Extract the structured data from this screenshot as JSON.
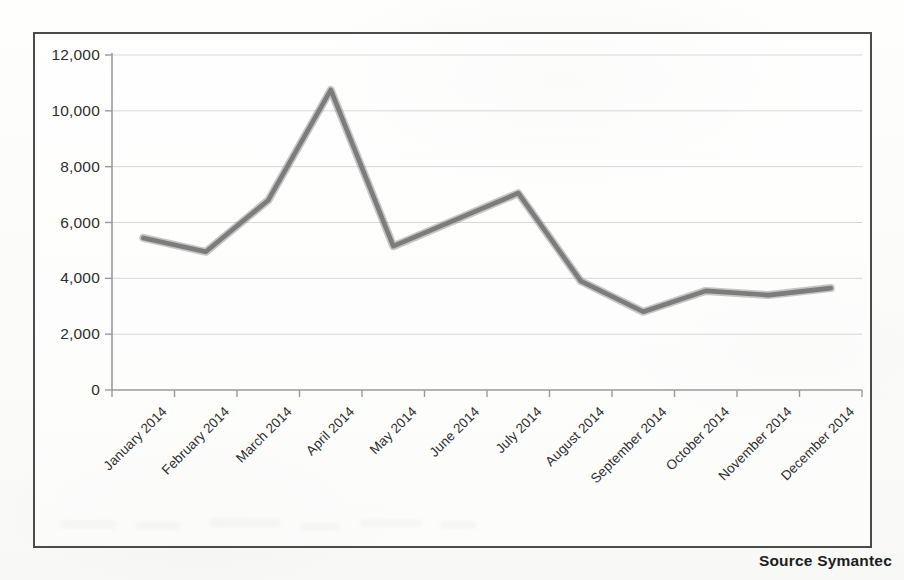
{
  "figure": {
    "source_note": "Source Symantec",
    "frame_color": "#4b4b4b",
    "line_color": "#7c7c7c",
    "gridline_color": "#d7d7d7",
    "axis_color": "#9a9a9a"
  },
  "chart_data": {
    "type": "line",
    "title": "",
    "subtitle": "",
    "xlabel": "",
    "ylabel": "",
    "categories": [
      "January 2014",
      "February 2014",
      "March 2014",
      "April 2014",
      "May 2014",
      "June 2014",
      "July 2014",
      "August 2014",
      "September 2014",
      "October 2014",
      "November 2014",
      "December 2014"
    ],
    "values": [
      5450,
      4950,
      6800,
      10750,
      5150,
      6100,
      7050,
      3900,
      2800,
      3550,
      3400,
      3650
    ],
    "series": [
      {
        "name": "",
        "values": [
          5450,
          4950,
          6800,
          10750,
          5150,
          6100,
          7050,
          3900,
          2800,
          3550,
          3400,
          3650
        ]
      }
    ],
    "ylim": [
      0,
      12000
    ],
    "ytick_values": [
      0,
      2000,
      4000,
      6000,
      8000,
      10000,
      12000
    ],
    "ytick_labels": [
      "0",
      "2,000",
      "4,000",
      "6,000",
      "8,000",
      "10,000",
      "12,000"
    ],
    "grid": true,
    "grid_axis": "y",
    "legend": false,
    "legend_position": "none",
    "annotations": [
      "Source Symantec"
    ]
  }
}
